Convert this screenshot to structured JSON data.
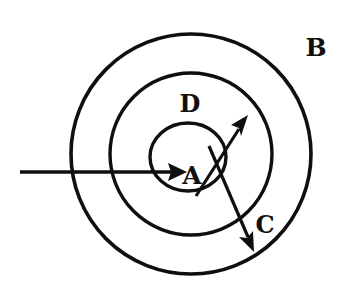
{
  "figure": {
    "type": "concentric-circle-diagram",
    "background_color": "#ffffff",
    "stroke_color": "#100f0f",
    "width": 350,
    "height": 300
  },
  "labels": {
    "outer_region": "B",
    "middle_region": "D",
    "inner_region": "A",
    "arrow_out_label": "C"
  },
  "regions": [
    {
      "name": "outer-circle",
      "label": "B",
      "cx": 191,
      "cy": 154,
      "r": 120,
      "stroke_width": 3.6
    },
    {
      "name": "middle-circle",
      "label": "D",
      "cx": 191,
      "cy": 154,
      "r": 81,
      "stroke_width": 3.4
    },
    {
      "name": "inner-circle",
      "label": "A",
      "cx": 188,
      "cy": 157,
      "rx": 38,
      "ry": 34,
      "stroke_width": 3.4
    }
  ],
  "arrows": [
    {
      "name": "incoming-arrow",
      "from_x": 20,
      "from_y": 172,
      "to_x": 187,
      "to_y": 172,
      "stroke_width": 3.2
    },
    {
      "name": "up-right-arrow",
      "from_x": 196,
      "from_y": 196,
      "to_x": 247,
      "to_y": 117,
      "stroke_width": 3.2
    },
    {
      "name": "down-right-arrow",
      "from_x": 209,
      "from_y": 146,
      "to_x": 253,
      "to_y": 250,
      "stroke_width": 3.2,
      "label": "C"
    }
  ],
  "label_positions": [
    {
      "name": "label-B",
      "text": "B",
      "x": 316,
      "y": 56,
      "font_size": 25
    },
    {
      "name": "label-D",
      "text": "D",
      "x": 190,
      "y": 112,
      "font_size": 24
    },
    {
      "name": "label-A",
      "text": "A",
      "x": 192,
      "y": 184,
      "font_size": 25
    },
    {
      "name": "label-C",
      "text": "C",
      "x": 265,
      "y": 233,
      "font_size": 24
    }
  ]
}
